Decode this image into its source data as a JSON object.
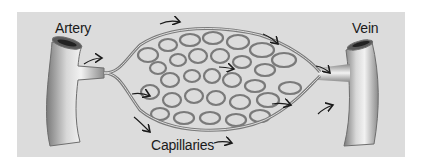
{
  "diagram": {
    "labels": {
      "artery": "Artery",
      "vein": "Vein",
      "capillaries": "Capillaries"
    },
    "colors": {
      "background": "#dcdcdc",
      "vessel_fill": "#b8b8b8",
      "vessel_edge": "#6e6e6e",
      "highlight": "#f4f4f4",
      "arrow": "#1a1a1a"
    },
    "flow_direction": "left-to-right"
  }
}
